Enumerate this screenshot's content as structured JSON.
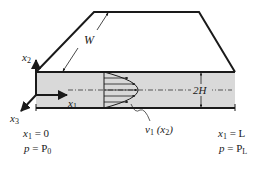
{
  "diagram": {
    "labels": {
      "width": "W",
      "axis_x1": "x",
      "axis_x1_sub": "1",
      "axis_x2": "x",
      "axis_x2_sub": "2",
      "axis_x3": "x",
      "axis_x3_sub": "3",
      "gap": "2H",
      "velocity_v": "v",
      "velocity_sub": "1",
      "velocity_arg_open": " (x",
      "velocity_arg_sub": "2",
      "velocity_arg_close": ")",
      "inlet_pos_var": "x",
      "inlet_pos_sub": "1",
      "inlet_pos_eq": " = 0",
      "inlet_p_var": "p",
      "inlet_p_eq": " = P",
      "inlet_p_sub": "0",
      "outlet_pos_var": "x",
      "outlet_pos_sub": "1",
      "outlet_pos_eq": " = L",
      "outlet_p_var": "p",
      "outlet_p_eq": " = P",
      "outlet_p_sub": "L"
    },
    "colors": {
      "fluid": "#d9d9d9",
      "stroke": "#1a1a1a",
      "background": "#ffffff"
    },
    "velocity_profile_arrows": 5
  }
}
